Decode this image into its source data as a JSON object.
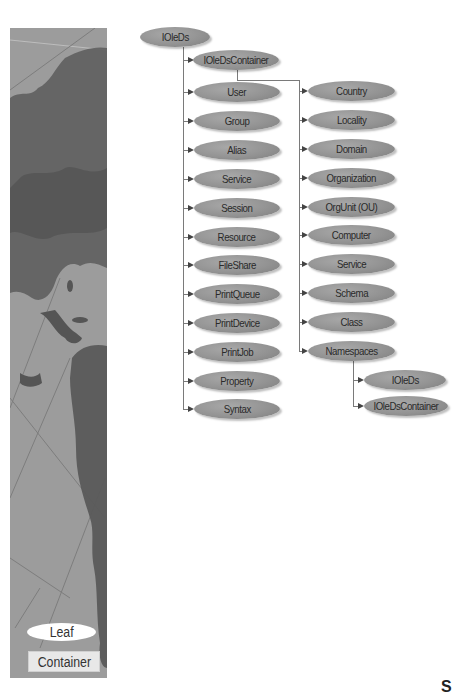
{
  "diagram": {
    "root": "IOleDs",
    "left_column": [
      "IOleDsContainer",
      "User",
      "Group",
      "Alias",
      "Service",
      "Session",
      "Resource",
      "FileShare",
      "PrintQueue",
      "PrintDevice",
      "PrintJob",
      "Property",
      "Syntax"
    ],
    "container_children": [
      "Country",
      "Locality",
      "Domain",
      "Organization",
      "OrgUnit (OU)",
      "Computer",
      "Service",
      "Schema",
      "Class",
      "Namespaces"
    ],
    "namespaces_children": [
      "IOleDs",
      "IOleDsContainer"
    ]
  },
  "legend": {
    "leaf_label": "Leaf",
    "container_label": "Container"
  },
  "colors": {
    "node_fill": "#939393",
    "map_background": "#9c9c9c",
    "connector": "#7a7a7a"
  },
  "corner_glyph": "S"
}
